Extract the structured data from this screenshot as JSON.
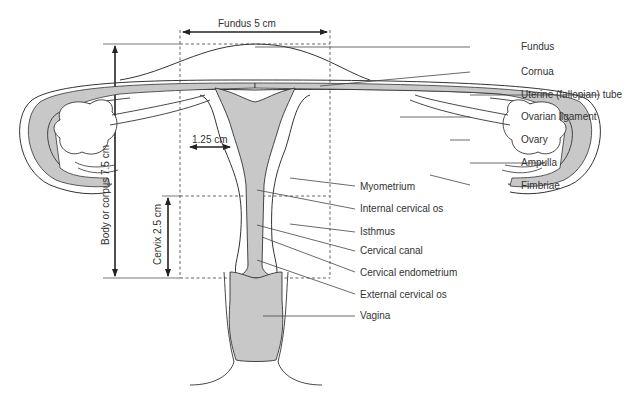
{
  "dimensions": {
    "fundus_width": "Fundus 5 cm",
    "wall_thickness": "1.25 cm",
    "body_length": "Body or corpus 7.5 cm",
    "cervix_length": "Cervix 2.5 cm"
  },
  "labels": [
    {
      "id": "fundus",
      "text": "Fundus"
    },
    {
      "id": "cornua",
      "text": "Cornua"
    },
    {
      "id": "uterine-tube",
      "text": "Uterine (fallopian) tube"
    },
    {
      "id": "ovarian-ligament",
      "text": "Ovarian ligament"
    },
    {
      "id": "ovary",
      "text": "Ovary"
    },
    {
      "id": "ampulla",
      "text": "Ampulla"
    },
    {
      "id": "fimbriae",
      "text": "Fimbriae"
    },
    {
      "id": "myometrium",
      "text": "Myometrium"
    },
    {
      "id": "internal-cervical-os",
      "text": "Internal cervical os"
    },
    {
      "id": "isthmus",
      "text": "Isthmus"
    },
    {
      "id": "cervical-canal",
      "text": "Cervical canal"
    },
    {
      "id": "cervical-endometrium",
      "text": "Cervical endometrium"
    },
    {
      "id": "external-cervical-os",
      "text": "External cervical os"
    },
    {
      "id": "vagina",
      "text": "Vagina"
    }
  ],
  "colors": {
    "stroke": "#333333",
    "fill_gray": "#c8c8c8",
    "leader": "#444444"
  }
}
